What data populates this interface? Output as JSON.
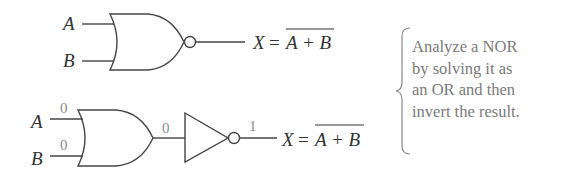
{
  "top_circuit": {
    "gate_type": "NOR",
    "inputs": [
      {
        "label": "A"
      },
      {
        "label": "B"
      }
    ],
    "output_lhs": "X",
    "equals": "=",
    "output_rhs": "A + B",
    "overbar": true
  },
  "bottom_circuit": {
    "gate_type": "OR followed by inverter",
    "inputs": [
      {
        "label": "A",
        "value": "0"
      },
      {
        "label": "B",
        "value": "0"
      }
    ],
    "or_output_value": "0",
    "inverter_output_value": "1",
    "output_lhs": "X",
    "equals": "=",
    "output_rhs": "A + B",
    "overbar": true
  },
  "note": {
    "lines": [
      "Analyze a NOR",
      "by solving it as",
      "an OR and then",
      "invert the result."
    ]
  },
  "colors": {
    "stroke": "#444444",
    "text": "#333333",
    "values": "#8a8a8a",
    "note": "#7a7a7a"
  }
}
